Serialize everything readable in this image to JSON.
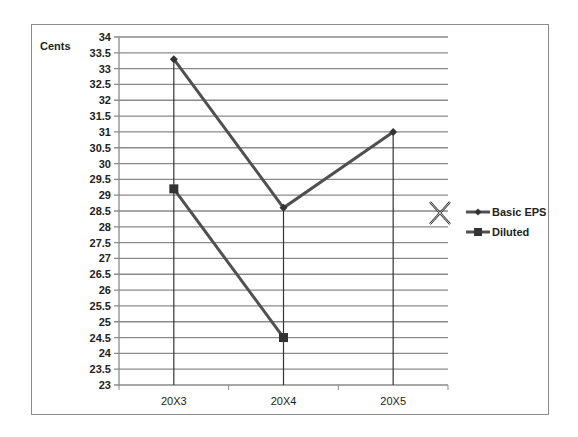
{
  "chart_data": {
    "type": "line",
    "title": "",
    "xlabel": "",
    "ylabel": "Cents",
    "categories": [
      "20X3",
      "20X4",
      "20X5"
    ],
    "series": [
      {
        "name": "Basic EPS",
        "marker": "diamond",
        "values": [
          33.3,
          28.6,
          31.0
        ]
      },
      {
        "name": "Diluted",
        "marker": "square",
        "values": [
          29.2,
          24.5,
          null
        ]
      }
    ],
    "ylim": [
      23,
      34
    ],
    "ytick_step": 0.5,
    "yticks": [
      "23",
      "23.5",
      "24",
      "24.5",
      "25",
      "25.5",
      "26",
      "26.5",
      "27",
      "27.5",
      "28",
      "28.5",
      "29",
      "29.5",
      "30",
      "30.5",
      "31",
      "31.5",
      "32",
      "32.5",
      "33",
      "33.5",
      "34"
    ],
    "grid": {
      "horizontal": true,
      "vertical_drop_lines": true
    },
    "legend_position": "right",
    "colors": {
      "series_line": "#505050",
      "gridline": "#8a8a8a",
      "axis": "#8a8a8a",
      "frame": "#8c8c8c"
    }
  },
  "cursor": {
    "type": "move-cursor",
    "x": 440,
    "y": 213
  }
}
